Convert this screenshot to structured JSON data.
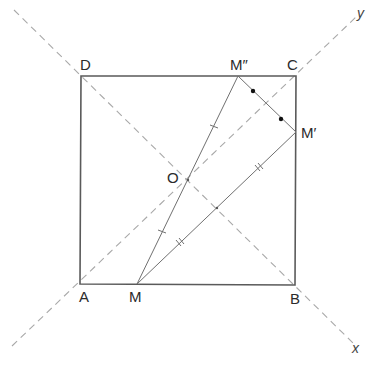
{
  "diagram": {
    "type": "geometry",
    "colors": {
      "square_stroke": "#5a5a5a",
      "segment_stroke": "#707070",
      "axis_dashed": "#a8a8a8",
      "dot_fill": "#111111",
      "label": "#2b2b2b"
    },
    "points": {
      "A": {
        "label": "A",
        "x": 80,
        "y": 284
      },
      "B": {
        "label": "B",
        "x": 295,
        "y": 285
      },
      "C": {
        "label": "C",
        "x": 296,
        "y": 76
      },
      "D": {
        "label": "D",
        "x": 81,
        "y": 76
      },
      "O": {
        "label": "O",
        "x": 188,
        "y": 180
      },
      "M": {
        "label": "M",
        "x": 137,
        "y": 284
      },
      "M1": {
        "label": "M′",
        "x": 296,
        "y": 132
      },
      "M2": {
        "label": "M″",
        "x": 238,
        "y": 76
      }
    },
    "axes": {
      "x": {
        "label": "x"
      },
      "y": {
        "label": "y"
      }
    },
    "segments": [
      {
        "from": "A",
        "to": "B",
        "style": "solid"
      },
      {
        "from": "B",
        "to": "C",
        "style": "solid"
      },
      {
        "from": "C",
        "to": "D",
        "style": "solid"
      },
      {
        "from": "D",
        "to": "A",
        "style": "solid"
      },
      {
        "from": "M",
        "to": "M2",
        "style": "solid",
        "mark": "single-tick"
      },
      {
        "from": "M",
        "to": "M1",
        "style": "solid",
        "mark": "double-tick"
      },
      {
        "from": "M2",
        "to": "M1",
        "style": "solid",
        "mark": "dot"
      }
    ],
    "dashed_lines": [
      {
        "name": "axis-y",
        "through": [
          "A",
          "C"
        ],
        "label": "y"
      },
      {
        "name": "axis-x",
        "through": [
          "D",
          "B"
        ],
        "label": "x"
      }
    ]
  }
}
